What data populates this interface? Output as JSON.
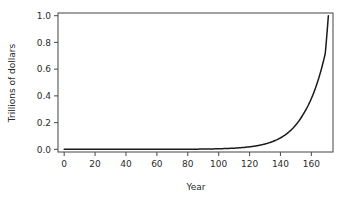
{
  "chart_data": {
    "type": "line",
    "title": "",
    "xlabel": "Year",
    "ylabel": "Trillions of dollars",
    "xlim": [
      -4,
      174
    ],
    "ylim": [
      -0.02,
      1.02
    ],
    "xticks": [
      0,
      20,
      40,
      60,
      80,
      100,
      120,
      140,
      160
    ],
    "xtick_labels": [
      "0",
      "20",
      "40",
      "60",
      "80",
      "100",
      "120",
      "140",
      "160"
    ],
    "yticks": [
      0.0,
      0.2,
      0.4,
      0.6,
      0.8,
      1.0
    ],
    "ytick_labels": [
      "0.0",
      "0.2",
      "0.4",
      "0.6",
      "0.8",
      "1.0"
    ],
    "grid": false,
    "legend": null,
    "line_color": "#1a1a1a",
    "axis_color": "#555555",
    "background": "#ffffff",
    "series": [
      {
        "name": "Compound growth",
        "x": [
          0,
          10,
          20,
          30,
          40,
          50,
          60,
          70,
          80,
          90,
          100,
          110,
          115,
          120,
          125,
          130,
          135,
          140,
          145,
          150,
          155,
          158,
          160,
          162,
          164,
          166,
          168,
          169,
          170,
          171
        ],
        "values": [
          0.0,
          0.0,
          0.0,
          0.0,
          0.0,
          0.0001,
          0.0002,
          0.0004,
          0.0009,
          0.0019,
          0.0041,
          0.0087,
          0.0128,
          0.0187,
          0.0273,
          0.04,
          0.0585,
          0.0856,
          0.1252,
          0.1832,
          0.268,
          0.3298,
          0.38,
          0.4377,
          0.5042,
          0.5808,
          0.669,
          0.7181,
          0.8537,
          1.0
        ]
      }
    ]
  },
  "axis": {
    "x_title": "Year",
    "y_title": "Trillions of dollars"
  }
}
